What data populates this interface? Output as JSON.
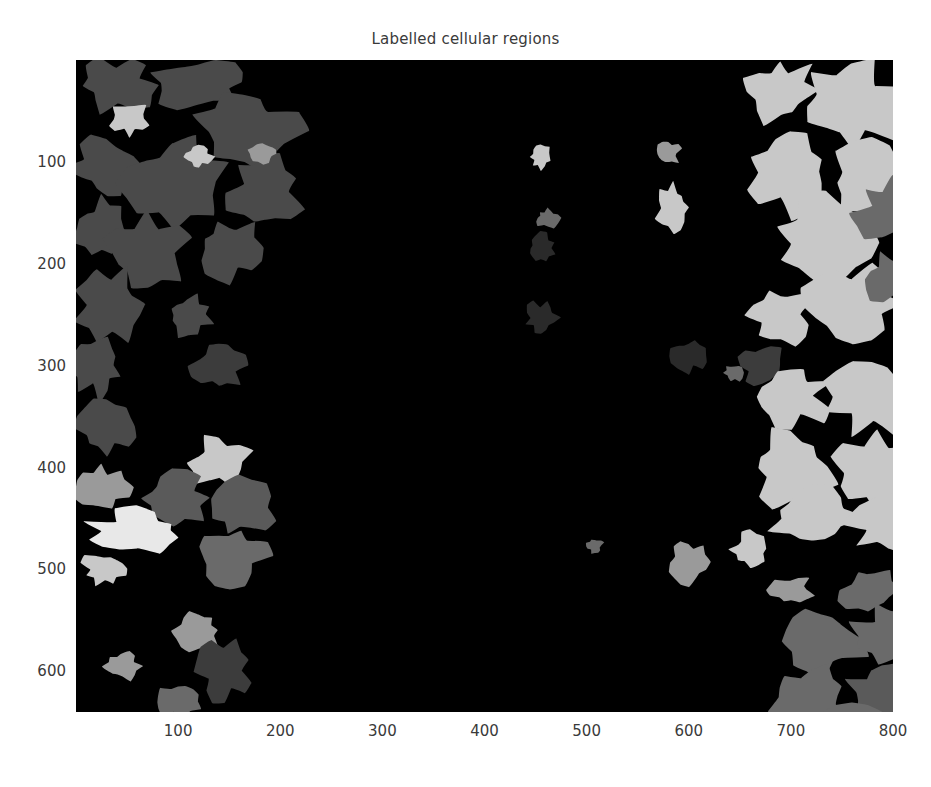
{
  "figure": {
    "title": "Labelled cellular regions",
    "width": 931,
    "height": 787,
    "background_color": "#ffffff",
    "text_color": "#3a3a3a"
  },
  "plot": {
    "left_px": 76,
    "top_px": 60,
    "width_px": 817,
    "height_px": 652,
    "background_color": "#000000"
  },
  "axes": {
    "x_ticks": [
      "100",
      "200",
      "300",
      "400",
      "500",
      "600",
      "700",
      "800"
    ],
    "y_ticks": [
      "100",
      "200",
      "300",
      "400",
      "500",
      "600"
    ],
    "x_label": "",
    "y_label": "",
    "x_range": [
      0,
      800
    ],
    "y_range": [
      0,
      640
    ],
    "grid": false
  },
  "chart_data": {
    "type": "heatmap",
    "title": "Labelled cellular regions",
    "xlabel": "",
    "ylabel": "",
    "xlim": [
      0,
      800
    ],
    "ylim": [
      0,
      640
    ],
    "grid": false,
    "legend": "none",
    "colormap": "gray",
    "label_levels": [
      {
        "label": 0,
        "color": "#000000",
        "name": "background"
      },
      {
        "label": 1,
        "color": "#3c3c3c",
        "name": "very-dark-gray-region"
      },
      {
        "label": 2,
        "color": "#4a4a4a",
        "name": "dark-gray-region"
      },
      {
        "label": 3,
        "color": "#5a5a5a",
        "name": "medium-dark-gray-region"
      },
      {
        "label": 4,
        "color": "#6a6a6a",
        "name": "medium-gray-region"
      },
      {
        "label": 5,
        "color": "#7d7d7d",
        "name": "gray-region"
      },
      {
        "label": 6,
        "color": "#9a9a9a",
        "name": "light-gray-region"
      },
      {
        "label": 7,
        "color": "#c8c8c8",
        "name": "bright-gray-region"
      },
      {
        "label": 8,
        "color": "#e8e8e8",
        "name": "near-white-region"
      }
    ],
    "regions": [
      {
        "cx": 40,
        "cy": 25,
        "rx": 38,
        "ry": 26,
        "color": "#4a4a4a"
      },
      {
        "cx": 120,
        "cy": 22,
        "rx": 46,
        "ry": 24,
        "color": "#4a4a4a"
      },
      {
        "cx": 52,
        "cy": 58,
        "rx": 20,
        "ry": 16,
        "color": "#c8c8c8"
      },
      {
        "cx": 165,
        "cy": 70,
        "rx": 52,
        "ry": 42,
        "color": "#4a4a4a"
      },
      {
        "cx": 30,
        "cy": 105,
        "rx": 34,
        "ry": 30,
        "color": "#4a4a4a"
      },
      {
        "cx": 95,
        "cy": 120,
        "rx": 48,
        "ry": 40,
        "color": "#4a4a4a"
      },
      {
        "cx": 185,
        "cy": 130,
        "rx": 34,
        "ry": 36,
        "color": "#4a4a4a"
      },
      {
        "cx": 120,
        "cy": 95,
        "rx": 14,
        "ry": 11,
        "color": "#c8c8c8"
      },
      {
        "cx": 183,
        "cy": 92,
        "rx": 13,
        "ry": 9,
        "color": "#9a9a9a"
      },
      {
        "cx": 25,
        "cy": 165,
        "rx": 26,
        "ry": 28,
        "color": "#4a4a4a"
      },
      {
        "cx": 70,
        "cy": 190,
        "rx": 40,
        "ry": 34,
        "color": "#4a4a4a"
      },
      {
        "cx": 150,
        "cy": 185,
        "rx": 30,
        "ry": 30,
        "color": "#4a4a4a"
      },
      {
        "cx": 35,
        "cy": 240,
        "rx": 34,
        "ry": 34,
        "color": "#4a4a4a"
      },
      {
        "cx": 110,
        "cy": 250,
        "rx": 22,
        "ry": 20,
        "color": "#4a4a4a"
      },
      {
        "cx": 22,
        "cy": 300,
        "rx": 24,
        "ry": 30,
        "color": "#4a4a4a"
      },
      {
        "cx": 140,
        "cy": 300,
        "rx": 26,
        "ry": 24,
        "color": "#3c3c3c"
      },
      {
        "cx": 30,
        "cy": 360,
        "rx": 30,
        "ry": 28,
        "color": "#4a4a4a"
      },
      {
        "cx": 140,
        "cy": 395,
        "rx": 30,
        "ry": 24,
        "color": "#c8c8c8"
      },
      {
        "cx": 25,
        "cy": 420,
        "rx": 26,
        "ry": 22,
        "color": "#9a9a9a"
      },
      {
        "cx": 95,
        "cy": 430,
        "rx": 34,
        "ry": 26,
        "color": "#5a5a5a"
      },
      {
        "cx": 160,
        "cy": 440,
        "rx": 32,
        "ry": 28,
        "color": "#5a5a5a"
      },
      {
        "cx": 60,
        "cy": 462,
        "rx": 46,
        "ry": 20,
        "color": "#e8e8e8"
      },
      {
        "cx": 150,
        "cy": 487,
        "rx": 36,
        "ry": 30,
        "color": "#6a6a6a"
      },
      {
        "cx": 28,
        "cy": 500,
        "rx": 22,
        "ry": 16,
        "color": "#c8c8c8"
      },
      {
        "cx": 120,
        "cy": 560,
        "rx": 22,
        "ry": 20,
        "color": "#9a9a9a"
      },
      {
        "cx": 145,
        "cy": 600,
        "rx": 26,
        "ry": 28,
        "color": "#3c3c3c"
      },
      {
        "cx": 45,
        "cy": 595,
        "rx": 18,
        "ry": 14,
        "color": "#9a9a9a"
      },
      {
        "cx": 100,
        "cy": 630,
        "rx": 20,
        "ry": 16,
        "color": "#6a6a6a"
      },
      {
        "cx": 455,
        "cy": 95,
        "rx": 11,
        "ry": 12,
        "color": "#c8c8c8"
      },
      {
        "cx": 580,
        "cy": 92,
        "rx": 12,
        "ry": 11,
        "color": "#9a9a9a"
      },
      {
        "cx": 462,
        "cy": 155,
        "rx": 12,
        "ry": 9,
        "color": "#6a6a6a"
      },
      {
        "cx": 585,
        "cy": 145,
        "rx": 16,
        "ry": 22,
        "color": "#c8c8c8"
      },
      {
        "cx": 455,
        "cy": 185,
        "rx": 14,
        "ry": 14,
        "color": "#2a2a2a"
      },
      {
        "cx": 455,
        "cy": 253,
        "rx": 16,
        "ry": 16,
        "color": "#2a2a2a"
      },
      {
        "cx": 600,
        "cy": 290,
        "rx": 16,
        "ry": 16,
        "color": "#2a2a2a"
      },
      {
        "cx": 645,
        "cy": 307,
        "rx": 10,
        "ry": 8,
        "color": "#6a6a6a"
      },
      {
        "cx": 508,
        "cy": 477,
        "rx": 8,
        "ry": 7,
        "color": "#6a6a6a"
      },
      {
        "cx": 600,
        "cy": 493,
        "rx": 18,
        "ry": 20,
        "color": "#9a9a9a"
      },
      {
        "cx": 690,
        "cy": 30,
        "rx": 36,
        "ry": 30,
        "color": "#c8c8c8"
      },
      {
        "cx": 760,
        "cy": 45,
        "rx": 50,
        "ry": 42,
        "color": "#c8c8c8"
      },
      {
        "cx": 700,
        "cy": 110,
        "rx": 40,
        "ry": 38,
        "color": "#c8c8c8"
      },
      {
        "cx": 780,
        "cy": 120,
        "rx": 46,
        "ry": 40,
        "color": "#c8c8c8"
      },
      {
        "cx": 735,
        "cy": 180,
        "rx": 52,
        "ry": 44,
        "color": "#c8c8c8"
      },
      {
        "cx": 800,
        "cy": 150,
        "rx": 34,
        "ry": 30,
        "color": "#6a6a6a"
      },
      {
        "cx": 690,
        "cy": 250,
        "rx": 30,
        "ry": 28,
        "color": "#c8c8c8"
      },
      {
        "cx": 760,
        "cy": 240,
        "rx": 44,
        "ry": 36,
        "color": "#c8c8c8"
      },
      {
        "cx": 800,
        "cy": 215,
        "rx": 26,
        "ry": 24,
        "color": "#6a6a6a"
      },
      {
        "cx": 672,
        "cy": 300,
        "rx": 22,
        "ry": 20,
        "color": "#3c3c3c"
      },
      {
        "cx": 700,
        "cy": 330,
        "rx": 36,
        "ry": 30,
        "color": "#c8c8c8"
      },
      {
        "cx": 780,
        "cy": 330,
        "rx": 46,
        "ry": 36,
        "color": "#c8c8c8"
      },
      {
        "cx": 700,
        "cy": 400,
        "rx": 40,
        "ry": 36,
        "color": "#c8c8c8"
      },
      {
        "cx": 785,
        "cy": 405,
        "rx": 46,
        "ry": 40,
        "color": "#c8c8c8"
      },
      {
        "cx": 720,
        "cy": 450,
        "rx": 44,
        "ry": 30,
        "color": "#c8c8c8"
      },
      {
        "cx": 795,
        "cy": 455,
        "rx": 38,
        "ry": 26,
        "color": "#c8c8c8"
      },
      {
        "cx": 660,
        "cy": 480,
        "rx": 18,
        "ry": 16,
        "color": "#c8c8c8"
      },
      {
        "cx": 700,
        "cy": 520,
        "rx": 22,
        "ry": 14,
        "color": "#9a9a9a"
      },
      {
        "cx": 775,
        "cy": 520,
        "rx": 26,
        "ry": 22,
        "color": "#6a6a6a"
      },
      {
        "cx": 730,
        "cy": 570,
        "rx": 40,
        "ry": 34,
        "color": "#6a6a6a"
      },
      {
        "cx": 800,
        "cy": 565,
        "rx": 38,
        "ry": 30,
        "color": "#6a6a6a"
      },
      {
        "cx": 720,
        "cy": 625,
        "rx": 38,
        "ry": 30,
        "color": "#6a6a6a"
      },
      {
        "cx": 790,
        "cy": 620,
        "rx": 34,
        "ry": 28,
        "color": "#5a5a5a"
      },
      {
        "cx": 760,
        "cy": 660,
        "rx": 44,
        "ry": 30,
        "color": "#6a6a6a"
      },
      {
        "cx": 795,
        "cy": 690,
        "rx": 30,
        "ry": 18,
        "color": "#e8e8e8"
      }
    ]
  }
}
